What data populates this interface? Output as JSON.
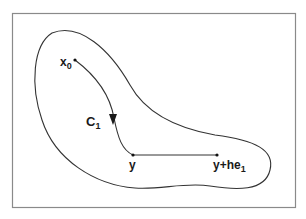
{
  "diagram": {
    "frame": {
      "stroke": "#8a8a8a"
    },
    "region": {
      "stroke": "#333333",
      "label": "domain region"
    },
    "labels": {
      "x0_main": "x",
      "x0_sub": "0",
      "c1_main": "C",
      "c1_sub": "1",
      "y": "y",
      "yhe_main": "y+he",
      "yhe_sub": "1"
    },
    "points": {
      "x0": [
        75,
        60
      ],
      "y": [
        133,
        155
      ],
      "y_plus_he1": [
        217,
        155
      ]
    },
    "curve": {
      "name": "C1",
      "from": "x0",
      "to": "y",
      "arrow": "down"
    },
    "segment": {
      "from": "y",
      "to": "y_plus_he1"
    }
  }
}
